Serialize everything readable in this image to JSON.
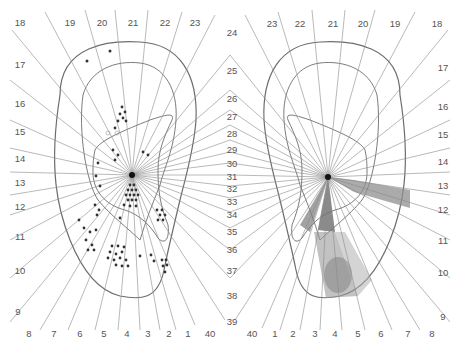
{
  "figure": {
    "center_labels": [
      "24",
      "25",
      "26",
      "27",
      "28",
      "29",
      "30",
      "31",
      "32",
      "33",
      "34",
      "35",
      "36",
      "37",
      "38",
      "39"
    ],
    "left_ear": {
      "top_labels": [
        "18",
        "19",
        "20",
        "21",
        "22",
        "23"
      ],
      "side_labels": [
        "17",
        "16",
        "15",
        "14",
        "13",
        "12",
        "11",
        "10",
        "9"
      ],
      "bottom_labels": [
        "8",
        "7",
        "6",
        "5",
        "4",
        "3",
        "2",
        "1",
        "40"
      ],
      "marker": "dots"
    },
    "right_ear": {
      "top_labels": [
        "23",
        "22",
        "21",
        "20",
        "19",
        "18"
      ],
      "side_labels": [
        "17",
        "16",
        "15",
        "14",
        "13",
        "12",
        "11",
        "10",
        "9"
      ],
      "bottom_labels": [
        "40",
        "1",
        "2",
        "3",
        "4",
        "5",
        "6",
        "7",
        "8"
      ],
      "marker": "shaded-sectors"
    },
    "colors": {
      "ray": "#8a8a8a",
      "ear_outline": "#6d6d6d",
      "dot": "#333333",
      "shade_dark": "#7a7a7a",
      "shade_mid": "#a8a8a8",
      "label": "#555555"
    }
  }
}
